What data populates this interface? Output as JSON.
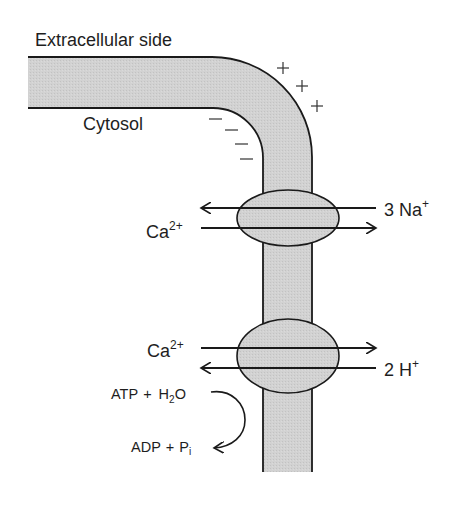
{
  "diagram": {
    "colors": {
      "membrane_fill": "#cfcfcf",
      "protein_fill": "#c8c8c8",
      "stroke": "#1a1a1a",
      "text": "#1e1e1e"
    },
    "labels": {
      "extracellular": "Extracellular side",
      "cytosol": "Cytosol"
    },
    "charges": {
      "outside": [
        "+",
        "+",
        "+"
      ],
      "inside": [
        "−",
        "−",
        "−",
        "−"
      ]
    },
    "antiporter": {
      "name": "Na+/Ca2+ antiporter",
      "left_ion": {
        "base": "Ca",
        "sup": "2+",
        "direction": "out"
      },
      "right_ion": {
        "base": "3 Na",
        "sup": "+",
        "direction": "in"
      }
    },
    "atpase": {
      "name": "Ca2+ ATPase",
      "left_ion": {
        "base": "Ca",
        "sup": "2+",
        "direction": "out"
      },
      "right_ion": {
        "base": "2 H",
        "sup": "+",
        "direction": "in"
      },
      "reaction": {
        "reactant_a": "ATP",
        "plus1": "+",
        "reactant_b_base": "H",
        "reactant_b_sub": "2",
        "reactant_b_tail": "O",
        "product_a": "ADP",
        "plus2": "+",
        "product_b_base": "P",
        "product_b_sub": "i"
      }
    }
  }
}
